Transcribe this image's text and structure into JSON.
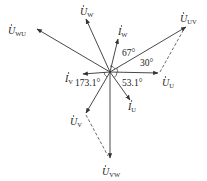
{
  "diagram": {
    "type": "phasor",
    "center": [
      110,
      72
    ],
    "colors": {
      "line": "#333333",
      "dash": "#444444",
      "text": "#222222"
    },
    "phasors": [
      {
        "id": "U_WU",
        "base": "U",
        "sub": "WU",
        "end": [
          37,
          29
        ],
        "label_pos": [
          8,
          34
        ]
      },
      {
        "id": "U_W",
        "base": "U",
        "sub": "W",
        "end": [
          86,
          19
        ],
        "label_pos": [
          80,
          15
        ]
      },
      {
        "id": "I_W",
        "base": "I",
        "sub": "W",
        "end": [
          118,
          39
        ],
        "label_pos": [
          118,
          35
        ]
      },
      {
        "id": "U_UV",
        "base": "U",
        "sub": "UV",
        "end": [
          186,
          27
        ],
        "label_pos": [
          180,
          22
        ]
      },
      {
        "id": "U_U",
        "base": "U",
        "sub": "U",
        "end": [
          158,
          73
        ],
        "label_pos": [
          162,
          86
        ]
      },
      {
        "id": "I_U",
        "base": "I",
        "sub": "U",
        "end": [
          130,
          100
        ],
        "label_pos": [
          128,
          110
        ]
      },
      {
        "id": "I_V",
        "base": "I",
        "sub": "V",
        "end": [
          83,
          74
        ],
        "label_pos": [
          65,
          82
        ]
      },
      {
        "id": "U_V",
        "base": "U",
        "sub": "V",
        "end": [
          86,
          113
        ],
        "label_pos": [
          70,
          125
        ]
      },
      {
        "id": "U_VW",
        "base": "U",
        "sub": "VW",
        "end": [
          110,
          158
        ],
        "label_pos": [
          102,
          175
        ]
      }
    ],
    "dashed": [
      {
        "from": [
          160,
          72
        ],
        "to": [
          184,
          29
        ]
      },
      {
        "from": [
          86,
          115
        ],
        "to": [
          108,
          156
        ]
      }
    ],
    "angles": [
      {
        "text": "67°",
        "pos": [
          122,
          56
        ]
      },
      {
        "text": "30°",
        "pos": [
          140,
          66
        ]
      },
      {
        "text": "53.1°",
        "pos": [
          122,
          86
        ]
      },
      {
        "text": "173.1°",
        "pos": [
          75,
          86
        ]
      }
    ]
  }
}
